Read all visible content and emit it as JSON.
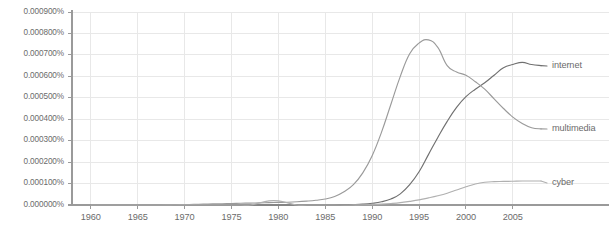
{
  "chart_data": {
    "type": "line",
    "title": "",
    "subtitle": "",
    "xlabel": "",
    "ylabel": "",
    "xlim": [
      1958,
      2008
    ],
    "ylim": [
      0.0,
      0.0009
    ],
    "grid": true,
    "legend_position": "right-inline",
    "x_tick_labels": [
      "1960",
      "1965",
      "1970",
      "1975",
      "1980",
      "1985",
      "1990",
      "1995",
      "2000",
      "2005"
    ],
    "x_ticks": [
      1960,
      1965,
      1970,
      1975,
      1980,
      1985,
      1990,
      1995,
      2000,
      2005
    ],
    "y_tick_labels": [
      "0.000900%",
      "0.000800%",
      "0.000700%",
      "0.000600%",
      "0.000500%",
      "0.000400%",
      "0.000300%",
      "0.000200%",
      "0.000100%",
      "0.000000%"
    ],
    "y_ticks": [
      0.0009,
      0.0008,
      0.0007,
      0.0006,
      0.0005,
      0.0004,
      0.0003,
      0.0002,
      0.0001,
      0.0
    ],
    "x": [
      1960,
      1961,
      1962,
      1963,
      1964,
      1965,
      1966,
      1967,
      1968,
      1969,
      1970,
      1971,
      1972,
      1973,
      1974,
      1975,
      1976,
      1977,
      1978,
      1979,
      1980,
      1981,
      1982,
      1983,
      1984,
      1985,
      1986,
      1987,
      1988,
      1989,
      1990,
      1991,
      1992,
      1993,
      1994,
      1995,
      1996,
      1997,
      1998,
      1999,
      2000,
      2001,
      2002,
      2003,
      2004,
      2005,
      2006,
      2007,
      2008
    ],
    "series": [
      {
        "name": "internet",
        "color": "#707070",
        "label": "internet",
        "label_x": 552,
        "label_y": 66,
        "values": [
          0.0,
          0.0,
          0.0,
          0.0,
          0.0,
          0.0,
          0.0,
          0.0,
          0.0,
          0.0,
          0.0,
          0.0,
          0.0,
          0.0,
          0.0,
          0.0,
          0.0,
          0.0,
          0.0,
          0.0,
          0.0,
          0.0,
          0.0,
          0.0,
          0.0,
          0.0,
          0.0,
          1e-06,
          2e-06,
          4e-06,
          8e-06,
          1.5e-05,
          2.8e-05,
          5.2e-05,
          9.5e-05,
          0.000155,
          0.000235,
          0.000315,
          0.00039,
          0.000455,
          0.000505,
          0.00054,
          0.00057,
          0.000605,
          0.00064,
          0.000655,
          0.000665,
          0.000655,
          0.00065
        ]
      },
      {
        "name": "multimedia",
        "color": "#9a9a9a",
        "label": "multimedia",
        "label_x": 552,
        "label_y": 129,
        "values": [
          0.0,
          0.0,
          0.0,
          0.0,
          0.0,
          0.0,
          0.0,
          0.0,
          5e-07,
          1e-06,
          2e-06,
          3e-06,
          4e-06,
          5e-06,
          6e-06,
          7e-06,
          8e-06,
          9e-06,
          1e-05,
          1.1e-05,
          1.2e-05,
          1.3e-05,
          1.5e-05,
          1.8e-05,
          2.2e-05,
          2.8e-05,
          4e-05,
          6.2e-05,
          9.5e-05,
          0.00015,
          0.00023,
          0.00034,
          0.00047,
          0.0006,
          0.000705,
          0.000755,
          0.00077,
          0.000735,
          0.00065,
          0.00062,
          0.000605,
          0.000575,
          0.00054,
          0.000495,
          0.00045,
          0.00041,
          0.00038,
          0.00036,
          0.000355
        ]
      },
      {
        "name": "cyber",
        "color": "#b0b0b0",
        "label": "cyber",
        "label_x": 552,
        "label_y": 183,
        "values": [
          0.0,
          0.0,
          0.0,
          0.0,
          0.0,
          0.0,
          0.0,
          0.0,
          0.0,
          0.0,
          0.0,
          0.0,
          0.0,
          0.0,
          0.0,
          0.0,
          0.0,
          0.0,
          1e-05,
          1.9e-05,
          1.9e-05,
          1e-05,
          0.0,
          0.0,
          0.0,
          0.0,
          0.0,
          0.0,
          5e-07,
          1e-06,
          2e-06,
          4e-06,
          7e-06,
          1.1e-05,
          1.7e-05,
          2.4e-05,
          3.3e-05,
          4.3e-05,
          5.5e-05,
          7e-05,
          8.5e-05,
          9.8e-05,
          0.000106,
          0.000109,
          0.00011,
          0.000111,
          0.000112,
          0.000112,
          0.000112
        ]
      }
    ]
  },
  "axis": {
    "axis_color": "#9a9a9a",
    "grid_color": "#e8e8e8",
    "tick_text_color": "#6b6b6b"
  }
}
